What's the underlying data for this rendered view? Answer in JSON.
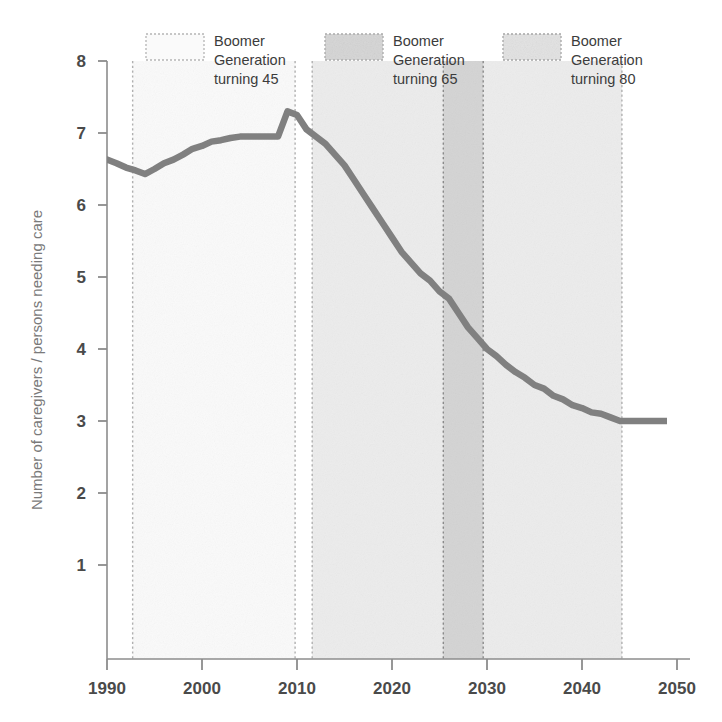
{
  "chart_data": {
    "type": "line",
    "title": "",
    "xlabel": "",
    "ylabel": "Number of caregivers / persons needing care",
    "xlim": [
      1988,
      2052
    ],
    "ylim": [
      0,
      8.45
    ],
    "xticks": [
      1990,
      2000,
      2010,
      2020,
      2030,
      2040,
      2050
    ],
    "xtick_labels": [
      "1990",
      "2000",
      "2010",
      "2020",
      "2030",
      "2040",
      "2050"
    ],
    "yticks": [
      1,
      2,
      3,
      4,
      5,
      6,
      7,
      8
    ],
    "ytick_labels": [
      "1",
      "2",
      "3",
      "4",
      "5",
      "6",
      "7",
      "8"
    ],
    "grid": false,
    "legend_position": "top",
    "line_color": "#808080",
    "series": [
      {
        "name": "Number of caregivers per person needing care",
        "x": [
          1990,
          1991,
          1992,
          1993,
          1994,
          1995,
          1996,
          1997,
          1998,
          1999,
          2000,
          2001,
          2002,
          2003,
          2004,
          2005,
          2006,
          2007,
          2008,
          2009,
          2010,
          2011,
          2012,
          2013,
          2014,
          2015,
          2016,
          2017,
          2018,
          2019,
          2020,
          2021,
          2022,
          2023,
          2024,
          2025,
          2026,
          2027,
          2028,
          2029,
          2030,
          2031,
          2032,
          2033,
          2034,
          2035,
          2036,
          2037,
          2038,
          2039,
          2040,
          2041,
          2042,
          2043,
          2044,
          2045,
          2046,
          2047,
          2048,
          2049,
          2050
        ],
        "values": [
          6.63,
          6.58,
          6.52,
          6.48,
          6.43,
          6.5,
          6.58,
          6.63,
          6.7,
          6.78,
          6.82,
          6.88,
          6.9,
          6.93,
          6.95,
          6.95,
          6.95,
          6.95,
          6.95,
          7.3,
          7.25,
          7.05,
          6.95,
          6.85,
          6.7,
          6.55,
          6.35,
          6.15,
          5.95,
          5.75,
          5.55,
          5.35,
          5.2,
          5.05,
          4.95,
          4.8,
          4.7,
          4.5,
          4.3,
          4.15,
          4.0,
          3.9,
          3.78,
          3.68,
          3.6,
          3.5,
          3.45,
          3.35,
          3.3,
          3.22,
          3.18,
          3.12,
          3.1,
          3.05,
          3.0,
          3.0,
          3.0,
          3.0,
          3.0,
          3.0,
          3.0
        ]
      }
    ],
    "bands": [
      {
        "name": "Boomer Generation turning 45",
        "start": 1992.7,
        "end": 2009.8,
        "color": "#fafafa",
        "border": "#b0b0b0"
      },
      {
        "name": "Boomer Generation turning 65",
        "start": 2011.6,
        "end": 2044.2,
        "color": "#ececec",
        "border": "#b0b0b0"
      },
      {
        "name": "Boomer Generation turning 80",
        "start": 2025.4,
        "end": 2029.6,
        "color": "#d4d4d4",
        "border": "#8a8a8a"
      }
    ]
  },
  "legend": {
    "items": [
      {
        "label_line1": "Boomer",
        "label_line2": "Generation",
        "label_line3": "turning 45",
        "swatch_color": "#fafafa",
        "swatch_border": "#b5b5b5"
      },
      {
        "label_line1": "Boomer",
        "label_line2": "Generation",
        "label_line3": "turning 65",
        "swatch_color": "#d5d5d5",
        "swatch_border": "#aaaaaa"
      },
      {
        "label_line1": "Boomer",
        "label_line2": "Generation",
        "label_line3": "turning 80",
        "swatch_color": "#e2e2e2",
        "swatch_border": "#a5a5a5"
      }
    ]
  },
  "axes": {
    "y_title": "Number of caregivers / persons needing care"
  }
}
